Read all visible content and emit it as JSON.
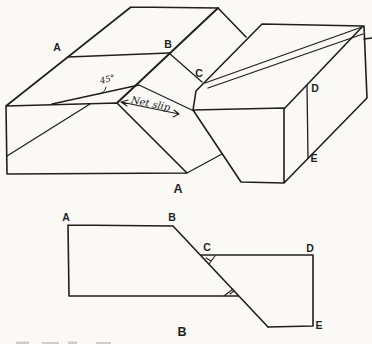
{
  "colors": {
    "ink": "#1f1f1f",
    "paper": "#faf9f6"
  },
  "block_diagram": {
    "caption": "A",
    "labels": {
      "A": "A",
      "B": "B",
      "C": "C",
      "D": "D",
      "E": "E"
    },
    "angle_label": "45°",
    "net_slip_label": "Net slip"
  },
  "map_diagram": {
    "caption": "B",
    "labels": {
      "A": "A",
      "B": "B",
      "C": "C",
      "D": "D",
      "E": "E"
    }
  }
}
